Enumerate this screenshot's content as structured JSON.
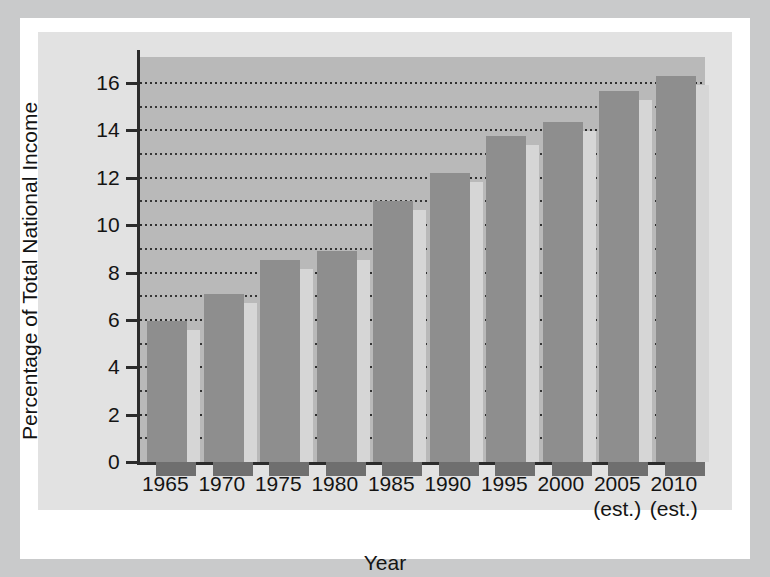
{
  "chart_data": {
    "type": "bar",
    "title": "",
    "xlabel": "Year",
    "ylabel": "Percentage of Total National Income",
    "categories": [
      "1965",
      "1970",
      "1975",
      "1980",
      "1985",
      "1990",
      "1995",
      "2000",
      "2005",
      "2010"
    ],
    "category_notes": [
      "",
      "",
      "",
      "",
      "",
      "",
      "",
      "",
      "(est.)",
      "(est.)"
    ],
    "values": [
      5.95,
      7.1,
      8.55,
      8.9,
      11.0,
      12.2,
      13.75,
      14.35,
      15.65,
      16.3
    ],
    "ylim": [
      0,
      17.1
    ],
    "ytick_labels": [
      "0",
      "2",
      "4",
      "6",
      "8",
      "10",
      "12",
      "14",
      "16"
    ],
    "ytick_values": [
      0,
      2,
      4,
      6,
      8,
      10,
      12,
      14,
      16
    ],
    "minor_gridline_values": [
      1,
      3,
      5,
      7,
      9,
      11,
      13,
      15
    ],
    "grid": true,
    "grid_style": "dotted",
    "legend": "none",
    "colors": {
      "bar_face": "#8e8e8e",
      "bar_highlight": "#d6d6d6",
      "bar_shadow": "#6f6f6f",
      "plot_background": "#b9b9b9",
      "panel_background": "#e2e2e2",
      "mat": "#ffffff",
      "frame": "#c9cacb",
      "axis": "#2b2b2b",
      "grid": "#2f2f2f",
      "text": "#141414"
    }
  }
}
